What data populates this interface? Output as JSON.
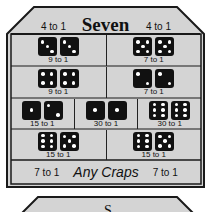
{
  "header": {
    "title": "Seven",
    "left_odds": "4 to 1",
    "right_odds": "4 to 1"
  },
  "rows": [
    {
      "cells": [
        {
          "dice": [
            3,
            3
          ],
          "odds": "9 to 1"
        },
        {
          "dice": [
            5,
            5
          ],
          "odds": "7 to 1"
        }
      ]
    },
    {
      "cells": [
        {
          "dice": [
            4,
            4
          ],
          "odds": "9 to 1"
        },
        {
          "dice": [
            2,
            2
          ],
          "odds": "7 to 1"
        }
      ]
    },
    {
      "cells": [
        {
          "dice": [
            1,
            2
          ],
          "odds": "15 to 1"
        },
        {
          "dice": [
            1,
            1
          ],
          "odds": "30 to 1"
        },
        {
          "dice": [
            6,
            6
          ],
          "odds": "30 to 1"
        }
      ]
    },
    {
      "cells": [
        {
          "dice": [
            6,
            5
          ],
          "odds": "15 to 1"
        },
        {
          "dice": [
            6,
            5
          ],
          "odds": "15 to 1"
        }
      ]
    }
  ],
  "footer": {
    "label": "Any Craps",
    "left_odds": "7 to 1",
    "right_odds": "7 to 1"
  },
  "next_panel": {
    "title_partial": "S"
  },
  "colors": {
    "panel": "#d4d4d4",
    "border": "#1a1a1a",
    "die": "#111111"
  }
}
